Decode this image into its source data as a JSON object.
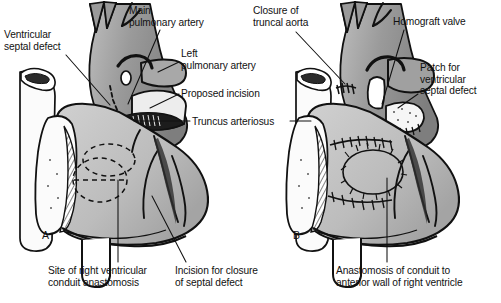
{
  "figure": {
    "background_color": "#ffffff",
    "ink_color": "#111111",
    "panels": [
      {
        "letter": "A",
        "caption_letter": "A",
        "description": "Preoperative anatomy with proposed incision"
      },
      {
        "letter": "B",
        "caption_letter": "B",
        "description": "Completed repair with homograft conduit"
      }
    ]
  },
  "labels": {
    "ventricular_septal_defect": "Ventricular\nseptal defect",
    "main_pulmonary_artery": "Main\npulmonary artery",
    "left_pulmonary_artery": "Left\npulmonary artery",
    "proposed_incision": "Proposed incision",
    "truncus_arteriosus": "Truncus arteriosus",
    "closure_of_truncal_aorta": "Closure of\ntruncal aorta",
    "homograft_valve": "Homograft valve",
    "patch_for_ventricular_septal_defect": "Patch for\nventricular\nseptal defect",
    "site_of_right_ventricular_conduit_anastomosis": "Site of right ventricular\nconduit anastomosis",
    "incision_for_closure_of_septal_defect": "Incision for closure\nof septal defect",
    "anastomosis_of_conduit_to_anterior_wall": "Anastomosis of conduit to\nanterior wall of right ventricle"
  },
  "colors": {
    "outline": "#111111",
    "great_vessel_dark_gray": "#8d8d8d",
    "great_vessel_mid_gray": "#a0a0a0",
    "ventricle_light_gray": "#c6c6c6",
    "ventricle_mid_gray": "#b3b3b3",
    "aorta_stump_white": "#fbfbfb",
    "patch_white": "#f4f4f4",
    "background": "#ffffff"
  }
}
